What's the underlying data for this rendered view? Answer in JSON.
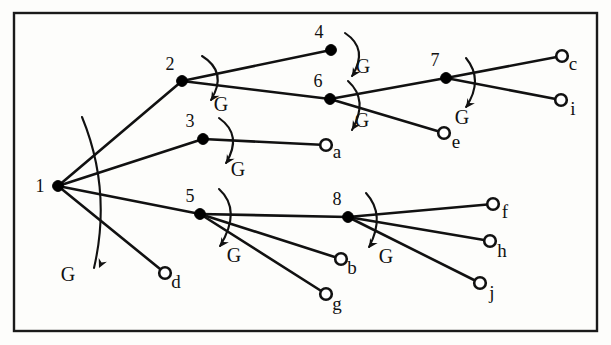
{
  "figure": {
    "type": "tree-diagram",
    "title": "",
    "border_color": "#1a1a1a",
    "node_color": "#000000",
    "leaf_color": "#ffffff",
    "edge_color": "#111111",
    "background": "#fdfdfb"
  },
  "nodes": {
    "internal": [
      {
        "id": "1",
        "label": "1",
        "x": 58,
        "y": 186,
        "label_x": 40,
        "label_y": 192
      },
      {
        "id": "2",
        "label": "2",
        "x": 182,
        "y": 81,
        "label_x": 170,
        "label_y": 70
      },
      {
        "id": "3",
        "label": "3",
        "x": 203,
        "y": 139,
        "label_x": 190,
        "label_y": 127
      },
      {
        "id": "4",
        "label": "4",
        "x": 331,
        "y": 50,
        "label_x": 319,
        "label_y": 38
      },
      {
        "id": "5",
        "label": "5",
        "x": 200,
        "y": 214,
        "label_x": 190,
        "label_y": 202
      },
      {
        "id": "6",
        "label": "6",
        "x": 330,
        "y": 99,
        "label_x": 318,
        "label_y": 87
      },
      {
        "id": "7",
        "label": "7",
        "x": 446,
        "y": 78,
        "label_x": 435,
        "label_y": 66
      },
      {
        "id": "8",
        "label": "8",
        "x": 348,
        "y": 217,
        "label_x": 337,
        "label_y": 205
      }
    ],
    "leaves": [
      {
        "id": "a",
        "label": "a",
        "x": 326,
        "y": 145,
        "label_x": 337,
        "label_y": 158
      },
      {
        "id": "b",
        "label": "b",
        "x": 341,
        "y": 259,
        "label_x": 352,
        "label_y": 274
      },
      {
        "id": "c",
        "label": "c",
        "x": 562,
        "y": 56,
        "label_x": 573,
        "label_y": 70
      },
      {
        "id": "d",
        "label": "d",
        "x": 165,
        "y": 273,
        "label_x": 176,
        "label_y": 288
      },
      {
        "id": "e",
        "label": "e",
        "x": 444,
        "y": 133,
        "label_x": 456,
        "label_y": 148
      },
      {
        "id": "f",
        "label": "f",
        "x": 493,
        "y": 204,
        "label_x": 505,
        "label_y": 218
      },
      {
        "id": "g",
        "label": "g",
        "x": 326,
        "y": 294,
        "label_x": 337,
        "label_y": 310
      },
      {
        "id": "h",
        "label": "h",
        "x": 490,
        "y": 241,
        "label_x": 502,
        "label_y": 257
      },
      {
        "id": "i",
        "label": "i",
        "x": 561,
        "y": 100,
        "label_x": 573,
        "label_y": 115
      },
      {
        "id": "j",
        "label": "j",
        "x": 480,
        "y": 283,
        "label_x": 492,
        "label_y": 299
      }
    ]
  },
  "edges": [
    {
      "from": "1",
      "to": "2"
    },
    {
      "from": "1",
      "to": "3"
    },
    {
      "from": "1",
      "to": "5"
    },
    {
      "from": "1",
      "to": "d"
    },
    {
      "from": "2",
      "to": "4"
    },
    {
      "from": "2",
      "to": "6"
    },
    {
      "from": "3",
      "to": "a"
    },
    {
      "from": "5",
      "to": "8"
    },
    {
      "from": "5",
      "to": "b"
    },
    {
      "from": "5",
      "to": "g"
    },
    {
      "from": "6",
      "to": "7"
    },
    {
      "from": "6",
      "to": "e"
    },
    {
      "from": "7",
      "to": "c"
    },
    {
      "from": "7",
      "to": "i"
    },
    {
      "from": "8",
      "to": "f"
    },
    {
      "from": "8",
      "to": "h"
    },
    {
      "from": "8",
      "to": "j"
    }
  ],
  "annotations": [
    {
      "id": "g-1",
      "label": "G",
      "at_node": "1",
      "label_x": 68,
      "label_y": 281,
      "arc": "M 82 117 Q 112 190 94 268",
      "tip_x": 99,
      "tip_y": 268,
      "tip_rot": 115
    },
    {
      "id": "g-2",
      "label": "G",
      "at_node": "2",
      "label_x": 221,
      "label_y": 111,
      "arc": "M 202 56 Q 228 72 211 100",
      "tip_x": 211,
      "tip_y": 101,
      "tip_rot": 122
    },
    {
      "id": "g-3",
      "label": "G",
      "at_node": "3",
      "label_x": 238,
      "label_y": 176,
      "arc": "M 219 118 Q 243 135 226 163",
      "tip_x": 226,
      "tip_y": 164,
      "tip_rot": 122
    },
    {
      "id": "g-4",
      "label": "G",
      "at_node": "4",
      "label_x": 363,
      "label_y": 73,
      "arc": "M 345 33 Q 369 49 352 76",
      "tip_x": 352,
      "tip_y": 77,
      "tip_rot": 122
    },
    {
      "id": "g-5",
      "label": "G",
      "at_node": "5",
      "label_x": 234,
      "label_y": 262,
      "arc": "M 219 189 Q 242 210 220 246",
      "tip_x": 220,
      "tip_y": 247,
      "tip_rot": 125
    },
    {
      "id": "g-6",
      "label": "G",
      "at_node": "6",
      "label_x": 362,
      "label_y": 127,
      "arc": "M 348 81 Q 369 100 352 130",
      "tip_x": 352,
      "tip_y": 130,
      "tip_rot": 122
    },
    {
      "id": "g-7",
      "label": "G",
      "at_node": "7",
      "label_x": 462,
      "label_y": 124,
      "arc": "M 466 58 Q 484 80 466 107",
      "tip_x": 466,
      "tip_y": 108,
      "tip_rot": 125
    },
    {
      "id": "g-8",
      "label": "G",
      "at_node": "8",
      "label_x": 386,
      "label_y": 263,
      "arc": "M 366 193 Q 386 215 369 247",
      "tip_x": 369,
      "tip_y": 248,
      "tip_rot": 123
    }
  ],
  "frame": {
    "x": 14,
    "y": 13,
    "width": 583,
    "height": 318
  }
}
